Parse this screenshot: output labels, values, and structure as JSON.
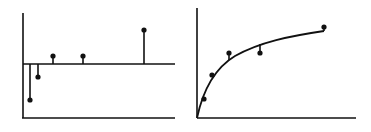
{
  "chart_data": [
    {
      "type": "stem",
      "title": "",
      "xlabel": "",
      "ylabel": "",
      "description": "Residuals plotted as stems from a zero baseline",
      "baseline_y": 64,
      "points": [
        {
          "x": 30,
          "y": 100
        },
        {
          "x": 38,
          "y": 77
        },
        {
          "x": 53,
          "y": 56
        },
        {
          "x": 83,
          "y": 56
        },
        {
          "x": 144,
          "y": 30
        }
      ],
      "axes": {
        "y_axis": {
          "x": 23,
          "y1": 13,
          "y2": 118
        },
        "x_axis": {
          "y": 118,
          "x1": 22,
          "x2": 175
        },
        "zero_line": {
          "y": 64,
          "x1": 23,
          "x2": 175
        }
      },
      "grid": false
    },
    {
      "type": "scatter",
      "title": "",
      "xlabel": "",
      "ylabel": "",
      "description": "Data points with fitted saturating curve and residual segments",
      "points": [
        {
          "x": 204,
          "y": 99,
          "curve_y": 100
        },
        {
          "x": 212,
          "y": 75,
          "curve_y": 76
        },
        {
          "x": 229,
          "y": 53,
          "curve_y": 60
        },
        {
          "x": 260,
          "y": 53,
          "curve_y": 44
        },
        {
          "x": 324,
          "y": 27,
          "curve_y": 31
        }
      ],
      "curve_path": "M197,118 C203,90 215,68 235,56 C260,42 290,36 324,31",
      "axes": {
        "y_axis": {
          "x": 197,
          "y1": 8,
          "y2": 118
        },
        "x_axis": {
          "y": 118,
          "x1": 197,
          "x2": 356
        }
      },
      "grid": false
    }
  ]
}
